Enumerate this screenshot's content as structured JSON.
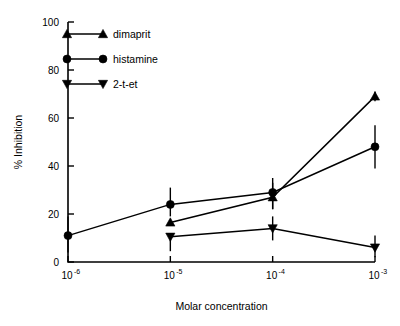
{
  "chart_data": {
    "type": "line",
    "title": "",
    "xlabel": "Molar concentration",
    "ylabel": "% Inhibition",
    "x": [
      "10-6",
      "10-5",
      "10-4",
      "10-3"
    ],
    "x_tick_labels": [
      "10",
      "10",
      "10",
      "10"
    ],
    "x_tick_exponents": [
      "-6",
      "-5",
      "-4",
      "-3"
    ],
    "y_tick_labels": [
      "0",
      "20",
      "40",
      "60",
      "80",
      "100"
    ],
    "y_ticks": [
      0,
      20,
      40,
      60,
      80,
      100
    ],
    "ylim": [
      0,
      100
    ],
    "grid": false,
    "legend_position": "top-left",
    "series": [
      {
        "name": "dimaprit",
        "marker": "triangle-up",
        "x": [
          "10-5",
          "10-4",
          "10-3"
        ],
        "values": [
          16.5,
          27.0,
          69.0
        ],
        "err_low": [
          16.5,
          22.0,
          67.0
        ],
        "err_high": [
          16.5,
          33.0,
          71.0
        ]
      },
      {
        "name": "histamine",
        "marker": "circle",
        "x": [
          "10-6",
          "10-5",
          "10-4",
          "10-3"
        ],
        "values": [
          11.0,
          24.0,
          29.0,
          48.0
        ],
        "err_low": [
          4.0,
          19.0,
          22.0,
          39.0
        ],
        "err_high": [
          19.0,
          31.0,
          35.0,
          57.0
        ]
      },
      {
        "name": "2-t-et",
        "marker": "triangle-down",
        "x": [
          "10-5",
          "10-4",
          "10-3"
        ],
        "values": [
          10.5,
          14.0,
          6.0
        ],
        "err_low": [
          4.5,
          9.0,
          2.0
        ],
        "err_high": [
          10.5,
          19.0,
          11.0
        ]
      }
    ]
  },
  "legend": {
    "entries": [
      {
        "label": "dimaprit",
        "marker": "triangle-up-icon"
      },
      {
        "label": "histamine",
        "marker": "circle-icon"
      },
      {
        "label": "2-t-et",
        "marker": "triangle-down-icon"
      }
    ]
  },
  "axes": {
    "x_title": "Molar concentration",
    "y_title": "% Inhibition"
  }
}
